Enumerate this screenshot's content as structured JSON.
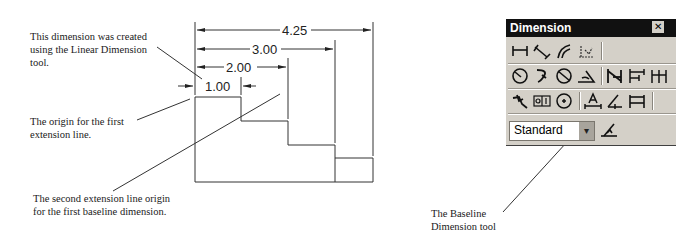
{
  "annotations": {
    "linear_note": [
      "This dimension was created",
      "using the Linear Dimension",
      "tool."
    ],
    "origin_note": [
      "The origin for the first",
      "extension line."
    ],
    "second_origin_note": [
      "The second extension line origin",
      "for the first baseline dimension."
    ],
    "baseline_tool_note": [
      "The Baseline",
      "Dimension tool"
    ]
  },
  "dimensions": {
    "d1": "1.00",
    "d2": "2.00",
    "d3": "3.00",
    "d4": "4.25"
  },
  "toolbar": {
    "title": "Dimension",
    "close_label": "✕",
    "rows": [
      [
        "linear-dimension",
        "aligned-dimension",
        "arc-length",
        "ordinate"
      ],
      [
        "radius",
        "jogged",
        "diameter",
        "angular",
        "quick-dimension",
        "baseline",
        "continue"
      ],
      [
        "quick-leader",
        "tolerance",
        "center-mark",
        "dimension-edit",
        "dimension-text-edit",
        "dimension-update"
      ]
    ],
    "style_select": {
      "value": "Standard"
    },
    "style_button": "dimension-style"
  }
}
